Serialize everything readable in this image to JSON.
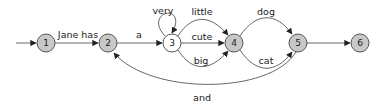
{
  "diagram": {
    "title": "",
    "colors": {
      "node_fill": "#c8c8c8",
      "node_fill_plain": "#ffffff",
      "stroke": "#555555",
      "text": "#222222"
    },
    "nodes": [
      {
        "id": "1",
        "label": "1",
        "x": 46,
        "y": 43,
        "filled": true
      },
      {
        "id": "2",
        "label": "2",
        "x": 108,
        "y": 43,
        "filled": true
      },
      {
        "id": "3",
        "label": "3",
        "x": 172,
        "y": 43,
        "filled": false
      },
      {
        "id": "4",
        "label": "4",
        "x": 234,
        "y": 43,
        "filled": true
      },
      {
        "id": "5",
        "label": "5",
        "x": 298,
        "y": 43,
        "filled": true
      },
      {
        "id": "6",
        "label": "6",
        "x": 360,
        "y": 43,
        "filled": true
      }
    ],
    "edges": [
      {
        "from": "start",
        "to": "1",
        "label": ""
      },
      {
        "from": "1",
        "to": "2",
        "label": "Jane has"
      },
      {
        "from": "2",
        "to": "3",
        "label": "a"
      },
      {
        "from": "3",
        "to": "3",
        "label": "very"
      },
      {
        "from": "3",
        "to": "4",
        "label": "little"
      },
      {
        "from": "3",
        "to": "4",
        "label": "cute"
      },
      {
        "from": "3",
        "to": "4",
        "label": "big"
      },
      {
        "from": "4",
        "to": "5",
        "label": "dog"
      },
      {
        "from": "4",
        "to": "5",
        "label": "cat"
      },
      {
        "from": "5",
        "to": "6",
        "label": ""
      },
      {
        "from": "5",
        "to": "2",
        "label": "and"
      }
    ]
  }
}
